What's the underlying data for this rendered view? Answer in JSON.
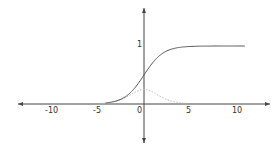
{
  "chart_data": {
    "type": "line",
    "title": "",
    "xlabel": "",
    "ylabel": "",
    "xlim": [
      -13,
      13
    ],
    "ylim": [
      -0.7,
      1.7
    ],
    "grid": false,
    "x_ticks": [
      "-10",
      "-5",
      "0",
      "5",
      "10"
    ],
    "y_ticks": [
      "1"
    ],
    "series": [
      {
        "name": "sigmoid",
        "color": "#555555",
        "style": "solid",
        "x": [
          -4,
          -3,
          -2,
          -1,
          0,
          1,
          2,
          3,
          4,
          5,
          10.5
        ],
        "values": [
          0.018,
          0.047,
          0.119,
          0.269,
          0.5,
          0.731,
          0.881,
          0.953,
          0.982,
          0.993,
          1.0
        ]
      },
      {
        "name": "sigmoid derivative",
        "color": "#bbbbbb",
        "style": "dotted",
        "x": [
          -4,
          -3,
          -2,
          -1,
          0,
          1,
          2,
          3,
          4
        ],
        "values": [
          0.018,
          0.045,
          0.105,
          0.197,
          0.25,
          0.197,
          0.105,
          0.045,
          0.018
        ]
      }
    ]
  },
  "axes": {
    "x_labels": [
      "-10",
      "-5",
      "0",
      "5",
      "10"
    ],
    "y_label_one": "1"
  },
  "colors": {
    "axis": "#444444",
    "curve": "#555555",
    "derivative": "#bbbbbb"
  }
}
